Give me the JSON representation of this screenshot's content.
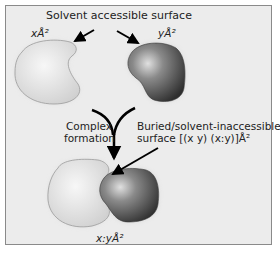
{
  "diagram": {
    "title": "Solvent accessible surface",
    "molecule_x_area": "xÅ²",
    "molecule_y_area": "yÅ²",
    "process_label_line1": "Complex",
    "process_label_line2": "formation",
    "buried_label_line1": "Buried/solvent-inaccessible",
    "buried_label_line2": "surface   [(x   y)   (x:y)]Å²",
    "complex_area": "x:yÅ²",
    "colors": {
      "background": "#ececec",
      "frame_border": "#8a8a8a",
      "molecule_x": "#dcdcdc",
      "molecule_y": "#5a5a5a",
      "arrow": "#000000"
    }
  }
}
